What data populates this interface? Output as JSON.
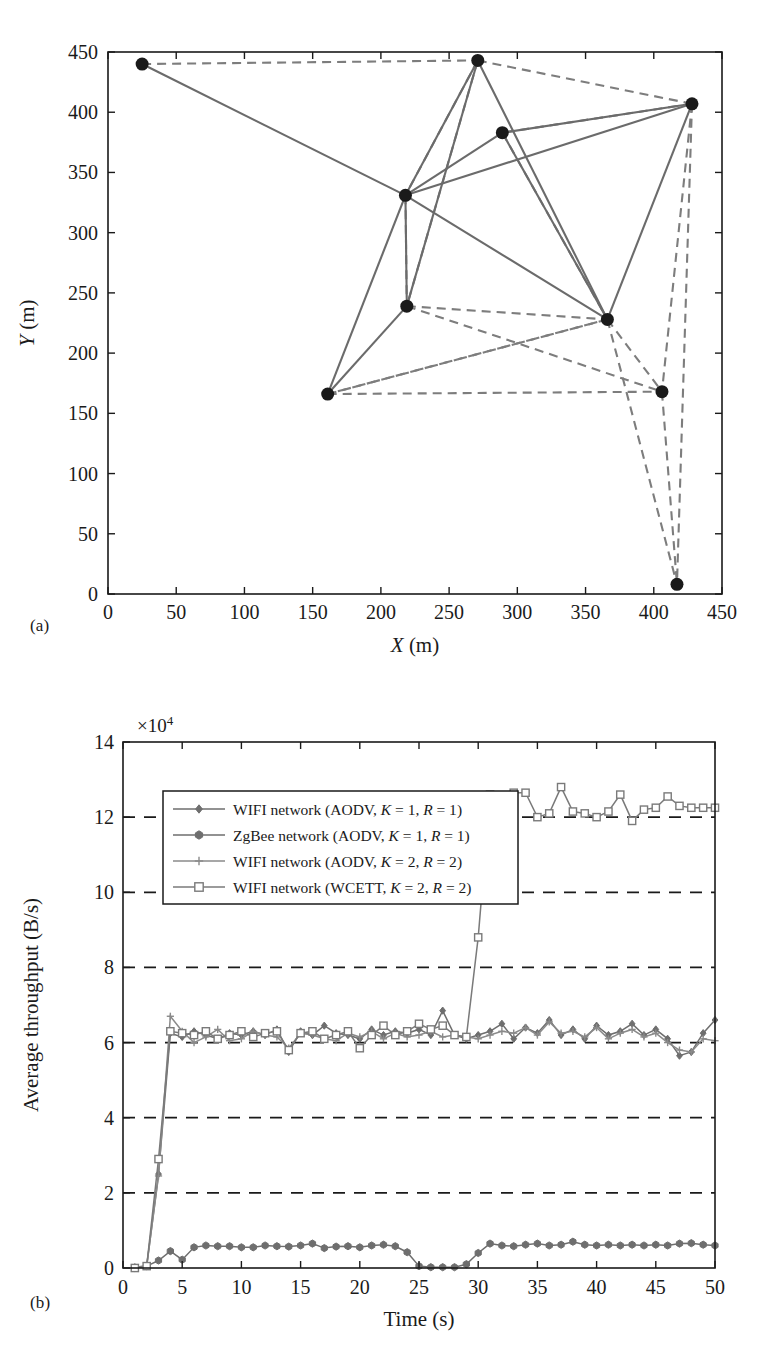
{
  "figure": {
    "panel_a_label": "(a)",
    "panel_b_label": "(b)"
  },
  "chart_data": [
    {
      "id": "network-topology",
      "type": "scatter",
      "title": "",
      "xlabel": "X (m)",
      "ylabel": "Y (m)",
      "xlim": [
        0,
        450
      ],
      "ylim": [
        0,
        450
      ],
      "xticks": [
        0,
        50,
        100,
        150,
        200,
        250,
        300,
        350,
        400,
        450
      ],
      "yticks": [
        0,
        50,
        100,
        150,
        200,
        250,
        300,
        350,
        400,
        450
      ],
      "grid": false,
      "legend": "none",
      "node_color": "#1a1a1a",
      "solid_edge_color": "#6b6b6b",
      "dashed_edge_color": "#7d7d7d",
      "nodes": [
        {
          "id": "n0",
          "x": 25,
          "y": 440
        },
        {
          "id": "n1",
          "x": 271,
          "y": 443
        },
        {
          "id": "n2",
          "x": 428,
          "y": 407
        },
        {
          "id": "n3",
          "x": 289,
          "y": 383
        },
        {
          "id": "n4",
          "x": 218,
          "y": 331
        },
        {
          "id": "n5",
          "x": 219,
          "y": 239
        },
        {
          "id": "n6",
          "x": 366,
          "y": 228
        },
        {
          "id": "n7",
          "x": 161,
          "y": 166
        },
        {
          "id": "n8",
          "x": 406,
          "y": 168
        },
        {
          "id": "n9",
          "x": 417,
          "y": 8
        }
      ],
      "solid_edges": [
        [
          "n0",
          "n4"
        ],
        [
          "n1",
          "n4"
        ],
        [
          "n1",
          "n6"
        ],
        [
          "n2",
          "n4"
        ],
        [
          "n2",
          "n3"
        ],
        [
          "n2",
          "n6"
        ],
        [
          "n3",
          "n4"
        ],
        [
          "n3",
          "n6"
        ],
        [
          "n4",
          "n5"
        ],
        [
          "n4",
          "n7"
        ],
        [
          "n4",
          "n6"
        ],
        [
          "n5",
          "n7"
        ],
        [
          "n1",
          "n5"
        ]
      ],
      "dashed_edges": [
        [
          "n0",
          "n1"
        ],
        [
          "n1",
          "n2"
        ],
        [
          "n1",
          "n4"
        ],
        [
          "n1",
          "n5"
        ],
        [
          "n2",
          "n3"
        ],
        [
          "n2",
          "n8"
        ],
        [
          "n2",
          "n9"
        ],
        [
          "n4",
          "n5"
        ],
        [
          "n3",
          "n6"
        ],
        [
          "n5",
          "n6"
        ],
        [
          "n5",
          "n8"
        ],
        [
          "n6",
          "n7"
        ],
        [
          "n6",
          "n8"
        ],
        [
          "n6",
          "n9"
        ],
        [
          "n7",
          "n8"
        ],
        [
          "n7",
          "n6"
        ],
        [
          "n8",
          "n9"
        ]
      ]
    },
    {
      "id": "average-throughput",
      "type": "line",
      "title": "",
      "xlabel": "Time (s)",
      "ylabel": "Average throughput (B/s)",
      "y_multiplier": "×10",
      "y_multiplier_exp": "4",
      "xlim": [
        0,
        50
      ],
      "ylim": [
        0,
        14
      ],
      "xticks": [
        0,
        5,
        10,
        15,
        20,
        25,
        30,
        35,
        40,
        45,
        50
      ],
      "yticks": [
        0,
        2,
        4,
        6,
        8,
        10,
        12,
        14
      ],
      "grid": true,
      "grid_style": "dashed-horizontal",
      "legend_position": "upper-left",
      "x": [
        1,
        2,
        3,
        4,
        5,
        6,
        7,
        8,
        9,
        10,
        11,
        12,
        13,
        14,
        15,
        16,
        17,
        18,
        19,
        20,
        21,
        22,
        23,
        24,
        25,
        26,
        27,
        28,
        29,
        30,
        31,
        32,
        33,
        34,
        35,
        36,
        37,
        38,
        39,
        40,
        41,
        42,
        43,
        44,
        45,
        46,
        47,
        48,
        49,
        50
      ],
      "series": [
        {
          "name": "WIFI network (AODV, K = 1, R = 1)",
          "marker": "diamond",
          "color": "#6e6e6e",
          "values": [
            0.02,
            0.05,
            2.5,
            6.25,
            6.15,
            6.3,
            6.2,
            6.1,
            6.25,
            6.2,
            6.3,
            6.2,
            6.35,
            5.75,
            6.3,
            6.2,
            6.45,
            6.25,
            6.2,
            6.1,
            6.35,
            6.2,
            6.3,
            6.25,
            6.35,
            6.2,
            6.85,
            6.2,
            6.1,
            6.2,
            6.3,
            6.5,
            6.1,
            6.4,
            6.25,
            6.6,
            6.2,
            6.35,
            6.1,
            6.45,
            6.2,
            6.3,
            6.5,
            6.2,
            6.35,
            6.1,
            5.65,
            5.75,
            6.25,
            6.6
          ]
        },
        {
          "name": "ZgBee network (AODV, K = 1, R = 1)",
          "marker": "hexagon-filled",
          "color": "#6e6e6e",
          "values": [
            0.0,
            0.05,
            0.2,
            0.45,
            0.22,
            0.55,
            0.6,
            0.58,
            0.58,
            0.55,
            0.55,
            0.6,
            0.58,
            0.57,
            0.6,
            0.65,
            0.53,
            0.57,
            0.58,
            0.55,
            0.6,
            0.62,
            0.58,
            0.42,
            0.05,
            0.02,
            0.02,
            0.02,
            0.1,
            0.4,
            0.65,
            0.6,
            0.58,
            0.62,
            0.65,
            0.6,
            0.62,
            0.7,
            0.62,
            0.6,
            0.62,
            0.6,
            0.62,
            0.6,
            0.62,
            0.6,
            0.65,
            0.66,
            0.62,
            0.6
          ]
        },
        {
          "name": "WIFI network (AODV, K = 2, R = 2)",
          "marker": "plus",
          "color": "#8a8a8a",
          "values": [
            0.02,
            0.05,
            2.45,
            6.7,
            6.3,
            6.0,
            6.15,
            6.35,
            6.05,
            6.1,
            6.3,
            6.2,
            6.15,
            5.85,
            6.25,
            6.2,
            6.1,
            6.05,
            6.25,
            6.15,
            6.3,
            6.1,
            6.25,
            6.15,
            6.2,
            6.3,
            6.15,
            6.2,
            6.15,
            6.1,
            6.2,
            6.3,
            6.25,
            6.4,
            6.2,
            6.55,
            6.25,
            6.3,
            6.15,
            6.4,
            6.1,
            6.25,
            6.35,
            6.15,
            6.25,
            6.0,
            5.8,
            5.75,
            6.1,
            6.05
          ]
        },
        {
          "name": "WIFI network (WCETT, K = 2, R = 2)",
          "marker": "square-open",
          "color": "#7a7a7a",
          "values": [
            0.0,
            0.05,
            2.9,
            6.3,
            6.25,
            6.2,
            6.3,
            6.1,
            6.2,
            6.3,
            6.15,
            6.25,
            6.3,
            5.8,
            6.25,
            6.3,
            6.1,
            6.2,
            6.3,
            5.85,
            6.2,
            6.45,
            6.2,
            6.3,
            6.5,
            6.35,
            6.45,
            6.2,
            6.15,
            8.8,
            12.6,
            12.5,
            12.65,
            12.65,
            12.0,
            12.1,
            12.8,
            12.15,
            12.1,
            12.0,
            12.15,
            12.6,
            11.9,
            12.2,
            12.25,
            12.55,
            12.3,
            12.25,
            12.25,
            12.25
          ]
        }
      ]
    }
  ]
}
